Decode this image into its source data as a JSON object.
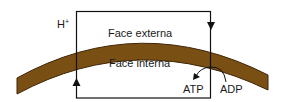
{
  "diagram": {
    "type": "membrane-proton-circuit",
    "labels": {
      "proton": "H",
      "proton_charge": "+",
      "outer_face": "Face externa",
      "inner_face": "Face interna",
      "atp": "ATP",
      "adp": "ADP"
    },
    "colors": {
      "membrane_fill": "#7a4f14",
      "membrane_edge": "#3e2606",
      "line": "#111111",
      "background": "#ffffff"
    },
    "arrows": [
      {
        "name": "proton-out-arrow",
        "direction": "down",
        "side": "right"
      },
      {
        "name": "proton-in-arrow",
        "direction": "up",
        "side": "left"
      },
      {
        "name": "adp-to-atp-arrow",
        "direction": "curved-left",
        "from": "ADP",
        "to": "ATP"
      }
    ]
  }
}
